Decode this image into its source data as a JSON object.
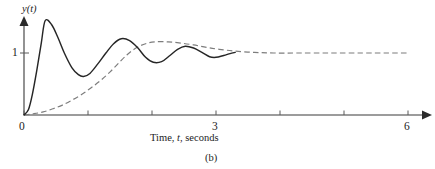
{
  "figure": {
    "caption": "(b)",
    "caption_name": "figure-caption-b"
  },
  "axes": {
    "y_label": "y(t)",
    "x_label_prefix": "Time, ",
    "x_label_var": "t",
    "x_label_suffix": ", seconds",
    "y_tick_labels": [
      "1"
    ],
    "x_tick_labels": [
      "0",
      "3",
      "6"
    ]
  },
  "chart_data": {
    "type": "line",
    "title": "",
    "subtitle": "",
    "caption": "(b)",
    "xlabel": "Time, t, seconds",
    "ylabel": "y(t)",
    "xlim": [
      0,
      6
    ],
    "ylim": [
      0,
      1.75
    ],
    "grid": false,
    "legend": null,
    "legend_position": "none",
    "x_ticks": [
      0,
      1,
      2,
      3,
      4,
      5,
      6
    ],
    "x_tick_labels_shown": {
      "0": "0",
      "3": "3",
      "6": "6"
    },
    "y_ticks": [
      1
    ],
    "y_tick_labels_shown": {
      "1": "1"
    },
    "axis_arrows": {
      "x": true,
      "y": true
    },
    "series": [
      {
        "name": "underdamped-response",
        "style": "solid",
        "color": "#262626",
        "description": "Underdamped second-order step response with decaying oscillation about the final value of 1, drawn from t=0 to about t=3.3 where it merges with the other response.",
        "final_value": 1.0,
        "t_start": 0.0,
        "t_end": 3.3,
        "extrema": [
          {
            "t": 0.33,
            "y": 1.52,
            "kind": "max"
          },
          {
            "t": 0.93,
            "y": 0.62,
            "kind": "min"
          },
          {
            "t": 1.52,
            "y": 1.23,
            "kind": "max"
          },
          {
            "t": 2.02,
            "y": 0.85,
            "kind": "min"
          },
          {
            "t": 2.52,
            "y": 1.11,
            "kind": "max"
          },
          {
            "t": 2.95,
            "y": 0.93,
            "kind": "min"
          }
        ],
        "points": [
          {
            "t": 0.0,
            "y": 0.0
          },
          {
            "t": 0.07,
            "y": 0.09
          },
          {
            "t": 0.13,
            "y": 0.33
          },
          {
            "t": 0.2,
            "y": 0.72
          },
          {
            "t": 0.27,
            "y": 1.16
          },
          {
            "t": 0.33,
            "y": 1.52
          },
          {
            "t": 0.43,
            "y": 1.46
          },
          {
            "t": 0.53,
            "y": 1.25
          },
          {
            "t": 0.63,
            "y": 1.0
          },
          {
            "t": 0.75,
            "y": 0.76
          },
          {
            "t": 0.85,
            "y": 0.65
          },
          {
            "t": 0.93,
            "y": 0.62
          },
          {
            "t": 1.03,
            "y": 0.67
          },
          {
            "t": 1.15,
            "y": 0.82
          },
          {
            "t": 1.28,
            "y": 1.0
          },
          {
            "t": 1.4,
            "y": 1.15
          },
          {
            "t": 1.52,
            "y": 1.23
          },
          {
            "t": 1.65,
            "y": 1.2
          },
          {
            "t": 1.78,
            "y": 1.08
          },
          {
            "t": 1.9,
            "y": 0.93
          },
          {
            "t": 2.02,
            "y": 0.85
          },
          {
            "t": 2.15,
            "y": 0.86
          },
          {
            "t": 2.28,
            "y": 0.96
          },
          {
            "t": 2.4,
            "y": 1.06
          },
          {
            "t": 2.52,
            "y": 1.11
          },
          {
            "t": 2.65,
            "y": 1.08
          },
          {
            "t": 2.78,
            "y": 1.01
          },
          {
            "t": 2.9,
            "y": 0.94
          },
          {
            "t": 3.0,
            "y": 0.93
          },
          {
            "t": 3.12,
            "y": 0.96
          },
          {
            "t": 3.22,
            "y": 0.99
          },
          {
            "t": 3.3,
            "y": 1.01
          }
        ]
      },
      {
        "name": "slow-damped-response",
        "style": "dashed",
        "color": "#7d7d7d",
        "description": "Slowly rising S-shaped step response with a small late overshoot, settling to the final value of 1, drawn from t=0 to t=6.",
        "final_value": 1.0,
        "t_start": 0.0,
        "t_end": 6.0,
        "extrema": [
          {
            "t": 2.05,
            "y": 1.18,
            "kind": "max"
          }
        ],
        "points": [
          {
            "t": 0.0,
            "y": 0.0
          },
          {
            "t": 0.15,
            "y": 0.02
          },
          {
            "t": 0.3,
            "y": 0.05
          },
          {
            "t": 0.45,
            "y": 0.1
          },
          {
            "t": 0.6,
            "y": 0.16
          },
          {
            "t": 0.75,
            "y": 0.24
          },
          {
            "t": 0.9,
            "y": 0.33
          },
          {
            "t": 1.05,
            "y": 0.44
          },
          {
            "t": 1.2,
            "y": 0.56
          },
          {
            "t": 1.35,
            "y": 0.7
          },
          {
            "t": 1.5,
            "y": 0.86
          },
          {
            "t": 1.62,
            "y": 0.98
          },
          {
            "t": 1.75,
            "y": 1.08
          },
          {
            "t": 1.9,
            "y": 1.15
          },
          {
            "t": 2.05,
            "y": 1.18
          },
          {
            "t": 2.25,
            "y": 1.18
          },
          {
            "t": 2.45,
            "y": 1.16
          },
          {
            "t": 2.65,
            "y": 1.13
          },
          {
            "t": 2.85,
            "y": 1.09
          },
          {
            "t": 3.05,
            "y": 1.06
          },
          {
            "t": 3.3,
            "y": 1.03
          },
          {
            "t": 3.6,
            "y": 1.01
          },
          {
            "t": 3.9,
            "y": 1.0
          },
          {
            "t": 4.3,
            "y": 1.0
          },
          {
            "t": 4.8,
            "y": 1.0
          },
          {
            "t": 5.3,
            "y": 1.0
          },
          {
            "t": 5.7,
            "y": 1.0
          },
          {
            "t": 6.0,
            "y": 1.0
          }
        ]
      }
    ]
  }
}
